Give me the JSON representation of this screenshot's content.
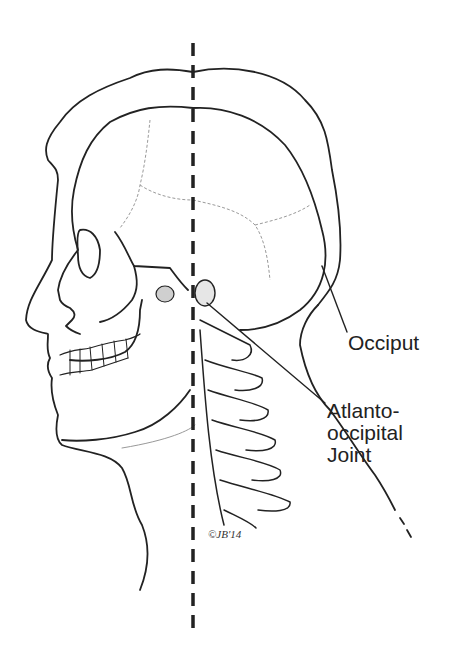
{
  "figure": {
    "midline": "vertical dashed line",
    "colors": {
      "line": "#222222",
      "suture": "#9a9a9a",
      "background": "#ffffff"
    }
  },
  "labels": {
    "occiput": "Occiput",
    "joint_line1": "Atlanto-",
    "joint_line2": "occipital",
    "joint_line3": "Joint"
  },
  "signature": "©JB'14"
}
